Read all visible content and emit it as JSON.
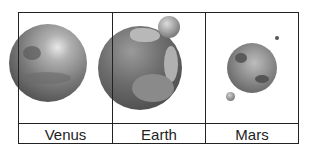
{
  "diagram": {
    "type": "planet-comparison-table",
    "columns": [
      {
        "label": "Venus",
        "moons": 0
      },
      {
        "label": "Earth",
        "moons": 1
      },
      {
        "label": "Mars",
        "moons": 2
      }
    ]
  }
}
